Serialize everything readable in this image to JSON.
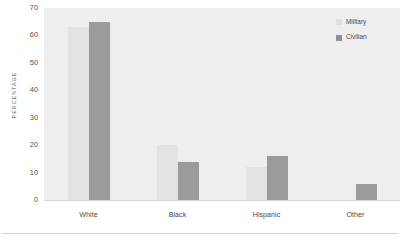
{
  "chart_data": {
    "type": "bar",
    "title": "",
    "xlabel": "",
    "ylabel": "PERCENTAGE",
    "categories": [
      "White",
      "Black",
      "Hispanic",
      "Other"
    ],
    "series": [
      {
        "name": "Military",
        "color": "#e3e3e3",
        "values": [
          63,
          20,
          12,
          0
        ]
      },
      {
        "name": "Civilian",
        "color": "#9b9b9b",
        "values": [
          65,
          14,
          16,
          6
        ]
      }
    ],
    "ylim": [
      0,
      70
    ],
    "yticks": [
      70,
      60,
      50,
      40,
      30,
      20,
      10,
      0
    ],
    "grid": false,
    "legend_position": "top-right"
  },
  "legend": {
    "entries": [
      {
        "label": "Military",
        "swatch": "legend-swatch-military"
      },
      {
        "label": "Civilian",
        "swatch": "legend-swatch-civilian"
      }
    ]
  }
}
